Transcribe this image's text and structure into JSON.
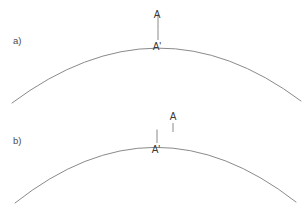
{
  "figure": {
    "width": 308,
    "height": 208,
    "background_color": "#ffffff",
    "line_color": "#8a8a8a",
    "label_color": "#3a3a3a",
    "panel_label_color": "#4a4a4a"
  },
  "panels": [
    {
      "id": "panel-a",
      "label": "a)",
      "label_x": 13,
      "label_y": 44,
      "arc": {
        "name": "surface-arc-a",
        "start_x": 12,
        "start_y": 103,
        "apex_x": 160,
        "apex_y": 29,
        "end_x": 301,
        "end_y": 101,
        "control_x": 158,
        "control_y": -6
      },
      "markers": [
        {
          "name": "marker-A",
          "label": "A",
          "label_x": 157,
          "label_y": 18,
          "tick_x": 158,
          "tick_y1": 14,
          "tick_y2": 29.5
        },
        {
          "name": "marker-A-prime",
          "label": "A'",
          "label_x": 157,
          "label_y": 50,
          "tick_x": 158,
          "tick_y1": 29.5,
          "tick_y2": 40
        }
      ]
    },
    {
      "id": "panel-b",
      "label": "b)",
      "label_x": 13,
      "label_y": 144,
      "arc": {
        "name": "surface-arc-b",
        "start_x": 15,
        "start_y": 203,
        "apex_x": 156,
        "apex_y": 129,
        "end_x": 296,
        "end_y": 202,
        "control_x": 155,
        "control_y": 92
      },
      "markers": [
        {
          "name": "marker-A",
          "label": "A",
          "label_x": 173,
          "label_y": 120,
          "tick_x": 173,
          "tick_y1": 123,
          "tick_y2": 132
        },
        {
          "name": "marker-A-prime",
          "label": "A'",
          "label_x": 156,
          "label_y": 153,
          "tick_x": 157,
          "tick_y1": 129.5,
          "tick_y2": 143
        }
      ]
    }
  ],
  "chart_data": {
    "type": "line",
    "title": "",
    "xlabel": "",
    "ylabel": "",
    "series": [
      {
        "name": "arc-a",
        "panel": "a)",
        "x": [
          12,
          50,
          90,
          125,
          160,
          200,
          240,
          270,
          301
        ],
        "y": [
          103,
          72,
          51,
          37,
          29,
          33,
          51,
          70,
          101
        ]
      },
      {
        "name": "arc-b",
        "panel": "b)",
        "x": [
          15,
          50,
          90,
          120,
          156,
          195,
          235,
          265,
          296
        ],
        "y": [
          203,
          172,
          149,
          137,
          129,
          134,
          152,
          172,
          202
        ]
      }
    ],
    "annotations": [
      {
        "panel": "a)",
        "text": "A",
        "x": 157,
        "y": 18
      },
      {
        "panel": "a)",
        "text": "A'",
        "x": 157,
        "y": 50
      },
      {
        "panel": "b)",
        "text": "A",
        "x": 173,
        "y": 120
      },
      {
        "panel": "b)",
        "text": "A'",
        "x": 156,
        "y": 153
      },
      {
        "panel": "a)",
        "text": "a)",
        "x": 13,
        "y": 44
      },
      {
        "panel": "b)",
        "text": "b)",
        "x": 13,
        "y": 144
      }
    ],
    "grid": false,
    "legend": "none"
  }
}
